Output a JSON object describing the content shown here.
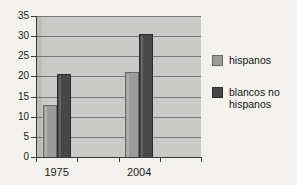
{
  "chart_data": {
    "type": "bar",
    "title": "",
    "subtitle": "",
    "xlabel": "",
    "ylabel": "",
    "categories": [
      "1975",
      "2004"
    ],
    "series": [
      {
        "name": "hispanos",
        "values": [
          13,
          21
        ],
        "color": "#9b9b99"
      },
      {
        "name": "blancos no hispanos",
        "values": [
          20.5,
          30.5
        ],
        "color": "#474747"
      }
    ],
    "ylim": [
      0,
      35
    ],
    "yticks": [
      0,
      5,
      10,
      15,
      20,
      25,
      30,
      35
    ],
    "ytick_labels": [
      "0",
      "5",
      "10",
      "15",
      "20",
      "25",
      "30",
      "35"
    ],
    "grid": true,
    "grid_axis": "y",
    "legend_position": "right",
    "plot_background": "#c9c9c7",
    "figure_background": "#f3f2ef",
    "axis_color": "#3a3a3a",
    "gridline_color": "#79797a"
  },
  "legend": {
    "entries": [
      {
        "label": "hispanos",
        "swatch": "light"
      },
      {
        "label": "blancos no hispanos",
        "swatch": "dark"
      }
    ]
  }
}
